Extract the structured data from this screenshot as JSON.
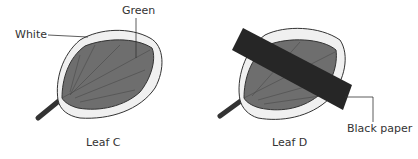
{
  "leaf_c": {
    "caption": "Leaf C",
    "labels": {
      "green": "Green",
      "white": "White"
    }
  },
  "leaf_d": {
    "caption": "Leaf D",
    "labels": {
      "black_paper": "Black paper"
    }
  },
  "colors": {
    "green_region": "#6e6e6e",
    "white_region": "#f0f0f0",
    "outline": "#333333",
    "black_paper": "#262626"
  }
}
